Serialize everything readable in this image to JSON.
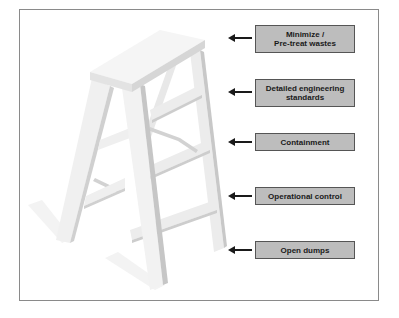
{
  "diagram": {
    "type": "ladder-hierarchy",
    "colors": {
      "box_fill": "#bdbdbd",
      "box_border": "#555555",
      "text": "#1a1a1a",
      "arrow": "#1a1a1a",
      "frame_border": "#8a8a8a",
      "ladder_light": "#f2f2f2",
      "ladder_shade": "#cfcfcf"
    },
    "steps": [
      {
        "label": "Minimize /\nPre-treat wastes",
        "position": "top"
      },
      {
        "label": "Detailed engineering\nstandards",
        "position": "upper"
      },
      {
        "label": "Containment",
        "position": "middle"
      },
      {
        "label": "Operational control",
        "position": "lower"
      },
      {
        "label": "Open dumps",
        "position": "bottom"
      }
    ]
  }
}
